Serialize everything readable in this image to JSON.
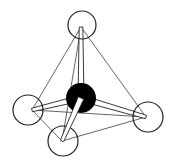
{
  "diagram": {
    "title": "",
    "type": "tetrahedral molecule",
    "colors": {
      "background": "#ffffff",
      "stroke": "#222222",
      "central_atom": "#000000",
      "outer_atom": "#ffffff"
    },
    "central_atom": {
      "x": 81,
      "y": 98,
      "r": 15
    },
    "outer_atoms": [
      {
        "name": "top",
        "x": 82,
        "y": 25,
        "r": 14,
        "vx": 81,
        "vy": 27
      },
      {
        "name": "left",
        "x": 28,
        "y": 110,
        "r": 15,
        "vx": 32,
        "vy": 110
      },
      {
        "name": "right",
        "x": 148,
        "y": 117,
        "r": 15,
        "vx": 146,
        "vy": 117
      },
      {
        "name": "bottom",
        "x": 63,
        "y": 141,
        "r": 15,
        "vx": 62,
        "vy": 141
      }
    ]
  }
}
